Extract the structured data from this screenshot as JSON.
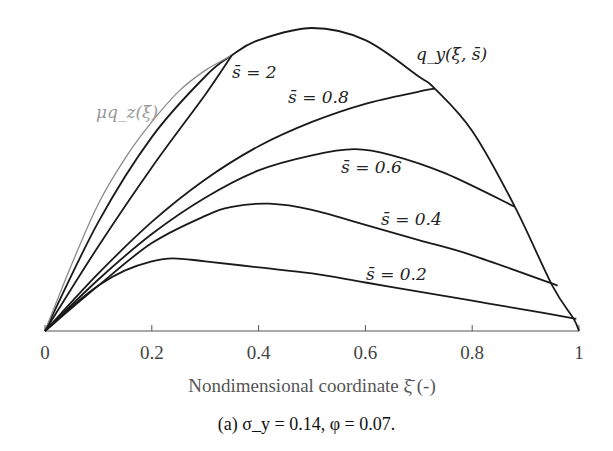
{
  "chart_data": {
    "type": "line",
    "title": "",
    "xlabel": "Nondimensional coordinate ξ̄ (-)",
    "ylabel": "",
    "xlim": [
      0,
      1
    ],
    "ylim": [
      0,
      1
    ],
    "x_ticks": [
      "0",
      "0.2",
      "0.4",
      "0.6",
      "0.8",
      "1"
    ],
    "grid": false,
    "legend": "inline curve labels",
    "series": [
      {
        "name": "q_y(ξ̄, s̄)",
        "label": "q_y(ξ̄, s̄)",
        "color": "#1a1a1a",
        "x": [
          0,
          0.1,
          0.2,
          0.3,
          0.35,
          0.4,
          0.5,
          0.6,
          0.7,
          0.73,
          0.8,
          0.88,
          0.95,
          0.99,
          1.0
        ],
        "y": [
          0,
          0.36,
          0.64,
          0.84,
          0.91,
          0.96,
          1.0,
          0.96,
          0.84,
          0.8,
          0.66,
          0.41,
          0.15,
          0.04,
          0
        ]
      },
      {
        "name": "μq_z(ξ̄)",
        "label": "μq_z(ξ̄)",
        "color": "#8a8a8a",
        "x": [
          0,
          0.05,
          0.1,
          0.15,
          0.2,
          0.25,
          0.3,
          0.35
        ],
        "y": [
          0,
          0.22,
          0.42,
          0.57,
          0.69,
          0.79,
          0.86,
          0.91
        ]
      },
      {
        "name": "s̄ = 2",
        "label": "s̄ = 2",
        "color": "#1a1a1a",
        "x": [
          0,
          0.1,
          0.2,
          0.3,
          0.35
        ],
        "y": [
          0,
          0.28,
          0.54,
          0.78,
          0.91
        ]
      },
      {
        "name": "s̄ = 0.8",
        "label": "s̄ = 0.8",
        "color": "#1a1a1a",
        "x": [
          0,
          0.1,
          0.2,
          0.3,
          0.4,
          0.5,
          0.6,
          0.7,
          0.73
        ],
        "y": [
          0,
          0.19,
          0.36,
          0.5,
          0.61,
          0.69,
          0.75,
          0.79,
          0.8
        ]
      },
      {
        "name": "s̄ = 0.6",
        "label": "s̄ = 0.6",
        "color": "#1a1a1a",
        "x": [
          0,
          0.1,
          0.2,
          0.3,
          0.4,
          0.5,
          0.58,
          0.65,
          0.75,
          0.88
        ],
        "y": [
          0,
          0.17,
          0.32,
          0.44,
          0.53,
          0.58,
          0.6,
          0.58,
          0.52,
          0.41
        ]
      },
      {
        "name": "s̄ = 0.4",
        "label": "s̄ = 0.4",
        "color": "#1a1a1a",
        "x": [
          0,
          0.1,
          0.2,
          0.3,
          0.35,
          0.42,
          0.5,
          0.6,
          0.7,
          0.8,
          0.96
        ],
        "y": [
          0,
          0.15,
          0.29,
          0.38,
          0.41,
          0.42,
          0.4,
          0.35,
          0.3,
          0.25,
          0.15
        ]
      },
      {
        "name": "s̄ = 0.2",
        "label": "s̄ = 0.2",
        "color": "#1a1a1a",
        "x": [
          0,
          0.05,
          0.1,
          0.15,
          0.2,
          0.24,
          0.3,
          0.4,
          0.5,
          0.6,
          0.7,
          0.8,
          0.9,
          0.995
        ],
        "y": [
          0,
          0.08,
          0.15,
          0.2,
          0.23,
          0.24,
          0.23,
          0.21,
          0.19,
          0.16,
          0.13,
          0.1,
          0.07,
          0.04
        ]
      }
    ]
  },
  "plot": {
    "origin_px": [
      45,
      331
    ],
    "x_unit_px": 534,
    "y_unit_px": 303,
    "labels": {
      "s2": "s̄ = 2",
      "s08": "s̄ = 0.8",
      "s06": "s̄ = 0.6",
      "s04": "s̄ = 0.4",
      "s02": "s̄ = 0.2",
      "qy": "q_y(ξ̄, s̄)",
      "muqz": "μq_z(ξ̄)"
    },
    "xlabel": "Nondimensional coordinate ξ̄ (-)",
    "ticks": [
      "0",
      "0.2",
      "0.4",
      "0.6",
      "0.8",
      "1"
    ]
  },
  "caption": "(a)  σ_y = 0.14,  φ = 0.07."
}
